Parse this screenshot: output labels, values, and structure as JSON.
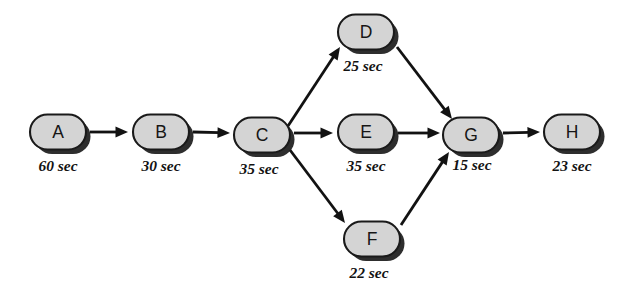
{
  "diagram": {
    "kind": "activity-precedence-network",
    "canvas": {
      "width": 640,
      "height": 292
    },
    "colors": {
      "node_fill": "#d4d4d4",
      "node_stroke": "#1a1a1a",
      "edge": "#121212",
      "text": "#131313",
      "background": "#ffffff"
    },
    "nodes": [
      {
        "id": "A",
        "label": "A",
        "duration": "60 sec",
        "cx": 58,
        "cy": 132,
        "w": 56,
        "h": 35,
        "label_x": 58,
        "label_y": 171
      },
      {
        "id": "B",
        "label": "B",
        "duration": "30 sec",
        "cx": 161,
        "cy": 132,
        "w": 56,
        "h": 35,
        "label_x": 161,
        "label_y": 171
      },
      {
        "id": "C",
        "label": "C",
        "duration": "35 sec",
        "cx": 262,
        "cy": 135,
        "w": 56,
        "h": 35,
        "label_x": 259,
        "label_y": 174
      },
      {
        "id": "D",
        "label": "D",
        "duration": "25 sec",
        "cx": 366,
        "cy": 32,
        "w": 56,
        "h": 35,
        "label_x": 363,
        "label_y": 71
      },
      {
        "id": "E",
        "label": "E",
        "duration": "35 sec",
        "cx": 366,
        "cy": 132,
        "w": 56,
        "h": 35,
        "label_x": 366,
        "label_y": 171
      },
      {
        "id": "F",
        "label": "F",
        "duration": "22 sec",
        "cx": 372,
        "cy": 239,
        "w": 56,
        "h": 35,
        "label_x": 369,
        "label_y": 278
      },
      {
        "id": "G",
        "label": "G",
        "duration": "15 sec",
        "cx": 471,
        "cy": 135,
        "w": 56,
        "h": 35,
        "label_x": 472,
        "label_y": 170
      },
      {
        "id": "H",
        "label": "H",
        "duration": "23 sec",
        "cx": 572,
        "cy": 132,
        "w": 56,
        "h": 35,
        "label_x": 572,
        "label_y": 171
      }
    ],
    "edges": [
      {
        "from": "A",
        "to": "B",
        "x1": 90,
        "y1": 132,
        "x2": 128,
        "y2": 132
      },
      {
        "from": "B",
        "to": "C",
        "x1": 193,
        "y1": 132,
        "x2": 230,
        "y2": 133
      },
      {
        "from": "C",
        "to": "D",
        "x1": 288,
        "y1": 126,
        "x2": 340,
        "y2": 47
      },
      {
        "from": "C",
        "to": "E",
        "x1": 294,
        "y1": 133,
        "x2": 333,
        "y2": 133
      },
      {
        "from": "C",
        "to": "F",
        "x1": 290,
        "y1": 150,
        "x2": 345,
        "y2": 223
      },
      {
        "from": "D",
        "to": "G",
        "x1": 397,
        "y1": 47,
        "x2": 452,
        "y2": 119
      },
      {
        "from": "E",
        "to": "G",
        "x1": 398,
        "y1": 133,
        "x2": 440,
        "y2": 133
      },
      {
        "from": "F",
        "to": "G",
        "x1": 401,
        "y1": 225,
        "x2": 449,
        "y2": 152
      },
      {
        "from": "G",
        "to": "H",
        "x1": 503,
        "y1": 133,
        "x2": 540,
        "y2": 132
      }
    ]
  }
}
